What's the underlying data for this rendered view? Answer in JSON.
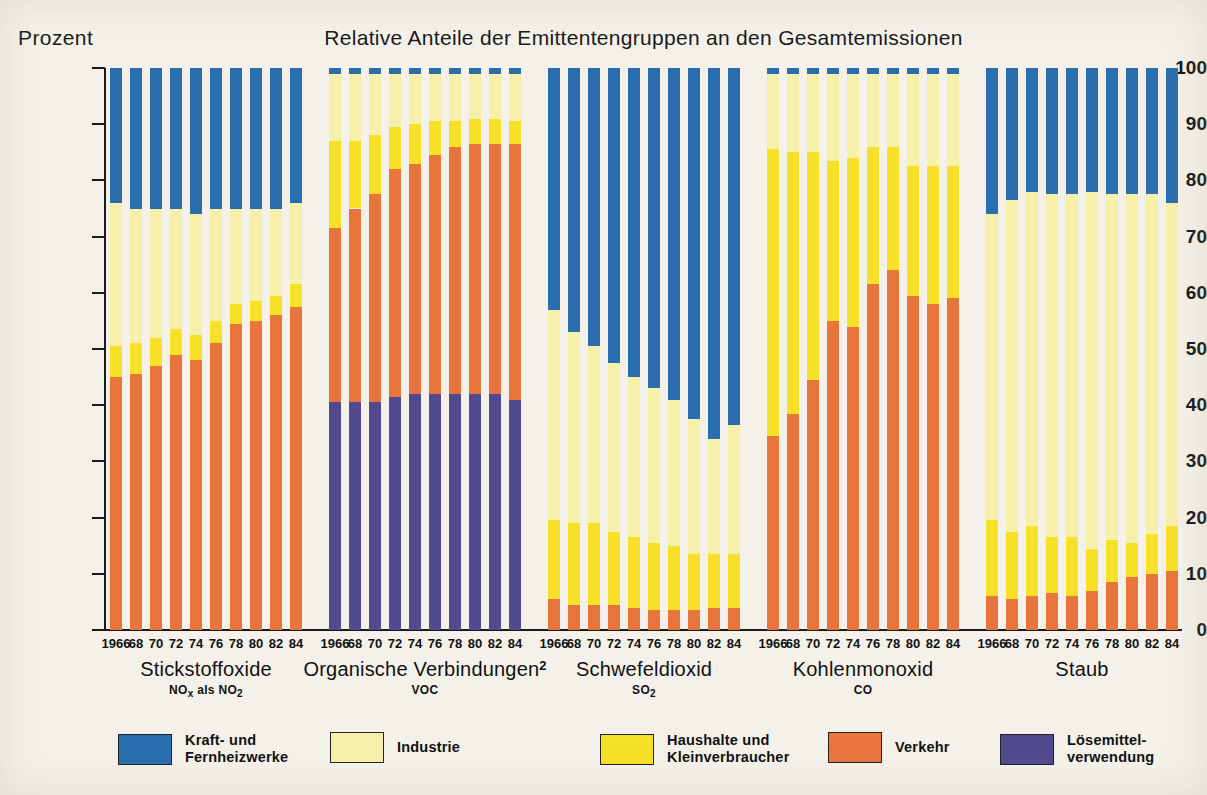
{
  "chart_data": {
    "type": "bar",
    "subtype": "stacked-percentage-grouped",
    "title": "Relative Anteile der Emittentengruppen an den Gesamtemissionen",
    "ylabel": "Prozent",
    "xlabel": "",
    "ylim": [
      0,
      100
    ],
    "ytick_labels": [
      "0",
      "10",
      "20",
      "30",
      "40",
      "50",
      "60",
      "70",
      "80",
      "90",
      "100"
    ],
    "ytick_values": [
      0,
      10,
      20,
      30,
      40,
      50,
      60,
      70,
      80,
      90,
      100
    ],
    "grid": false,
    "legend_position": "bottom",
    "categories": [
      "1966",
      "68",
      "70",
      "72",
      "74",
      "76",
      "78",
      "80",
      "82",
      "84"
    ],
    "series_order": [
      "Verkehr",
      "Haushalte und Kleinverbraucher",
      "Industrie",
      "Kraft- und Fernheizwerke"
    ],
    "series_colors": {
      "Kraft- und Fernheizwerke": "#2a6eb0",
      "Industrie": "#f7f0ab",
      "Haushalte und Kleinverbraucher": "#f7e028",
      "Verkehr": "#e8753c",
      "Lösemittelverwendung": "#524a8e"
    },
    "groups": [
      {
        "name": "Stickstoffoxide",
        "subtitle": "NOx als NO2",
        "superscript": "",
        "stack_order": [
          "Verkehr",
          "Haushalte und Kleinverbraucher",
          "Industrie",
          "Kraft- und Fernheizwerke"
        ],
        "series": [
          {
            "name": "Verkehr",
            "values": [
              45,
              45.5,
              47,
              49,
              48,
              51,
              54.5,
              55,
              56,
              57.5
            ]
          },
          {
            "name": "Haushalte und Kleinverbraucher",
            "values": [
              5.5,
              5.5,
              5,
              4.5,
              4.5,
              4,
              3.5,
              3.5,
              3.5,
              4
            ]
          },
          {
            "name": "Industrie",
            "values": [
              25.5,
              24,
              23,
              21.5,
              21.5,
              20,
              17,
              16.5,
              15.5,
              14.5
            ]
          },
          {
            "name": "Kraft- und Fernheizwerke",
            "values": [
              24,
              25,
              25,
              25,
              26,
              25,
              25,
              25,
              25,
              24
            ]
          }
        ]
      },
      {
        "name": "Organische Verbindungen",
        "subtitle": "VOC",
        "superscript": "2",
        "stack_order": [
          "Lösemittelverwendung",
          "Verkehr",
          "Haushalte und Kleinverbraucher",
          "Industrie",
          "Kraft- und Fernheizwerke"
        ],
        "series": [
          {
            "name": "Lösemittelverwendung",
            "values": [
              40.5,
              40.5,
              40.5,
              41.5,
              42,
              42,
              42,
              42,
              42,
              41
            ]
          },
          {
            "name": "Verkehr",
            "values": [
              31,
              34.5,
              37,
              40.5,
              41,
              42.5,
              44,
              44.5,
              44.5,
              45.5
            ]
          },
          {
            "name": "Haushalte und Kleinverbraucher",
            "values": [
              15.5,
              12,
              10.5,
              7.5,
              7,
              6,
              4.5,
              4.5,
              4.5,
              4
            ]
          },
          {
            "name": "Industrie",
            "values": [
              12,
              12,
              11,
              9.5,
              9,
              8.5,
              8.5,
              8,
              8,
              8.5
            ]
          },
          {
            "name": "Kraft- und Fernheizwerke",
            "values": [
              1,
              1,
              1,
              1,
              1,
              1,
              1,
              1,
              1,
              1
            ]
          }
        ]
      },
      {
        "name": "Schwefeldioxid",
        "subtitle": "SO2",
        "superscript": "",
        "stack_order": [
          "Verkehr",
          "Haushalte und Kleinverbraucher",
          "Industrie",
          "Kraft- und Fernheizwerke"
        ],
        "series": [
          {
            "name": "Verkehr",
            "values": [
              5.5,
              4.5,
              4.5,
              4.5,
              4,
              3.5,
              3.5,
              3.5,
              4,
              4
            ]
          },
          {
            "name": "Haushalte und Kleinverbraucher",
            "values": [
              14,
              14.5,
              14.5,
              13,
              12.5,
              12,
              11.5,
              10,
              9.5,
              9.5
            ]
          },
          {
            "name": "Industrie",
            "values": [
              37.5,
              34,
              31.5,
              30,
              28.5,
              27.5,
              26,
              24,
              20.5,
              23
            ]
          },
          {
            "name": "Kraft- und Fernheizwerke",
            "values": [
              43,
              47,
              49.5,
              52.5,
              55,
              57,
              59,
              62.5,
              66,
              63.5
            ]
          }
        ]
      },
      {
        "name": "Kohlenmonoxid",
        "subtitle": "CO",
        "superscript": "",
        "stack_order": [
          "Verkehr",
          "Haushalte und Kleinverbraucher",
          "Industrie",
          "Kraft- und Fernheizwerke"
        ],
        "series": [
          {
            "name": "Verkehr",
            "values": [
              34.5,
              38.5,
              44.5,
              55,
              54,
              61.5,
              64,
              59.5,
              58,
              59
            ]
          },
          {
            "name": "Haushalte und Kleinverbraucher",
            "values": [
              51,
              46.5,
              40.5,
              28.5,
              30,
              24.5,
              22,
              23,
              24.5,
              23.5
            ]
          },
          {
            "name": "Industrie",
            "values": [
              13.5,
              14,
              14,
              15.5,
              15,
              13,
              13,
              16.5,
              16.5,
              16.5
            ]
          },
          {
            "name": "Kraft- und Fernheizwerke",
            "values": [
              1,
              1,
              1,
              1,
              1,
              1,
              1,
              1,
              1,
              1
            ]
          }
        ]
      },
      {
        "name": "Staub",
        "subtitle": "",
        "superscript": "",
        "stack_order": [
          "Verkehr",
          "Haushalte und Kleinverbraucher",
          "Industrie",
          "Kraft- und Fernheizwerke"
        ],
        "series": [
          {
            "name": "Verkehr",
            "values": [
              6,
              5.5,
              6,
              6.5,
              6,
              7,
              8.5,
              9.5,
              10,
              10.5
            ]
          },
          {
            "name": "Haushalte und Kleinverbraucher",
            "values": [
              13.5,
              12,
              12.5,
              10,
              10.5,
              7.5,
              7.5,
              6,
              7,
              8
            ]
          },
          {
            "name": "Industrie",
            "values": [
              54.5,
              59,
              59.5,
              61,
              61,
              63.5,
              61.5,
              62,
              60.5,
              57.5
            ]
          },
          {
            "name": "Kraft- und Fernheizwerke",
            "values": [
              26,
              23.5,
              22,
              22.5,
              22.5,
              22,
              22.5,
              22.5,
              22.5,
              24
            ]
          }
        ]
      }
    ],
    "legend": [
      {
        "label": "Kraft- und\nFernheizwerke",
        "color": "#2a6eb0"
      },
      {
        "label": "Industrie",
        "color": "#f7f0ab"
      },
      {
        "label": "Haushalte und\nKleinverbraucher",
        "color": "#f7e028"
      },
      {
        "label": "Verkehr",
        "color": "#e8753c"
      },
      {
        "label": "Lösemittel-\nverwendung",
        "color": "#524a8e"
      }
    ]
  }
}
